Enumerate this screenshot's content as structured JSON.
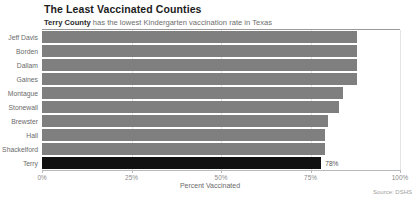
{
  "header": {
    "title": "The Least Vaccinated Counties",
    "subtitle_strong": "Terry County",
    "subtitle_rest": " has the lowest Kindergarten vaccination rate in Texas"
  },
  "footer": {
    "source": "Source: DSHS"
  },
  "colors": {
    "bar": "#7f7f7f",
    "highlight": "#111111",
    "grid": "#e4e4e4",
    "axis": "#b9b9b9",
    "text": "#6b6b6b",
    "title": "#1c1c1c"
  },
  "chart_data": {
    "type": "bar",
    "orientation": "horizontal",
    "title": "The Least Vaccinated Counties",
    "subtitle": "Terry County has the lowest Kindergarten vaccination rate in Texas",
    "xlabel": "Percent Vaccinated",
    "ylabel": "",
    "xlim": [
      0,
      100
    ],
    "xticks": [
      0,
      25,
      50,
      75,
      100
    ],
    "xticklabels": [
      "0%",
      "25%",
      "50%",
      "75%",
      "100%"
    ],
    "grid": true,
    "legend": false,
    "source": "Source: DSHS",
    "categories": [
      "Jeff Davis",
      "Borden",
      "Dallam",
      "Gaines",
      "Montague",
      "Stonewall",
      "Brewster",
      "Hall",
      "Shackelford",
      "Terry"
    ],
    "values": [
      88,
      88,
      88,
      88,
      84,
      83,
      80,
      79,
      79,
      78
    ],
    "highlight_index": 9,
    "data_labels": [
      null,
      null,
      null,
      null,
      null,
      null,
      null,
      null,
      null,
      "78%"
    ]
  }
}
